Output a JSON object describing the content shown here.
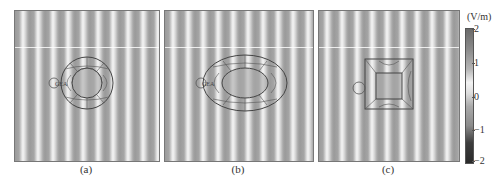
{
  "figure": {
    "panels": [
      {
        "id": "a",
        "caption": "(a)",
        "shape": "circle"
      },
      {
        "id": "b",
        "caption": "(b)",
        "shape": "ellipse"
      },
      {
        "id": "c",
        "caption": "(c)",
        "shape": "square"
      }
    ],
    "colorbar": {
      "unit": "(V/m)",
      "ticks": [
        "2",
        "1",
        "0",
        "−1",
        "−2"
      ],
      "range": [
        -2,
        2
      ]
    }
  }
}
